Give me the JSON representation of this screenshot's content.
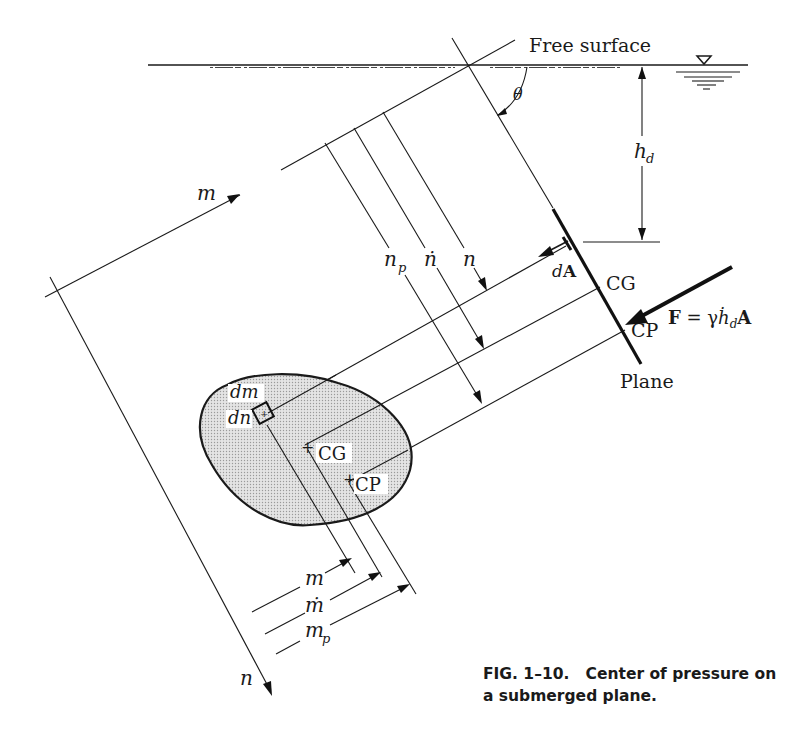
{
  "figure": {
    "labels": {
      "free_surface": "Free surface",
      "theta": "θ",
      "h_d": "h",
      "h_d_sub": "d",
      "m_axis": "m",
      "n_axis": "n",
      "n_p": "n",
      "n_p_sub": "p",
      "n_bar": "ṅ",
      "n": "n",
      "dA_d": "d",
      "dA_A": "A",
      "CG_plane": "CG",
      "CP_plane": "CP",
      "force_F": "F",
      "force_eq": " = γ",
      "force_h": "ḣ",
      "force_h_sub": "d",
      "force_A": "A",
      "plane": "Plane",
      "dm": "dm",
      "dn": "dn",
      "CG_area": "CG",
      "CP_area": "CP",
      "m_dim": "m",
      "m_bar_dim": "ṁ",
      "m_p_dim": "m",
      "m_p_sub": "p"
    },
    "caption": {
      "line1": "FIG. 1–10.   Center of pressure on",
      "line2": "a submerged plane."
    },
    "colors": {
      "ink": "#1a1a1a",
      "area_fill": "#d9d9d9",
      "background": "#ffffff"
    }
  }
}
